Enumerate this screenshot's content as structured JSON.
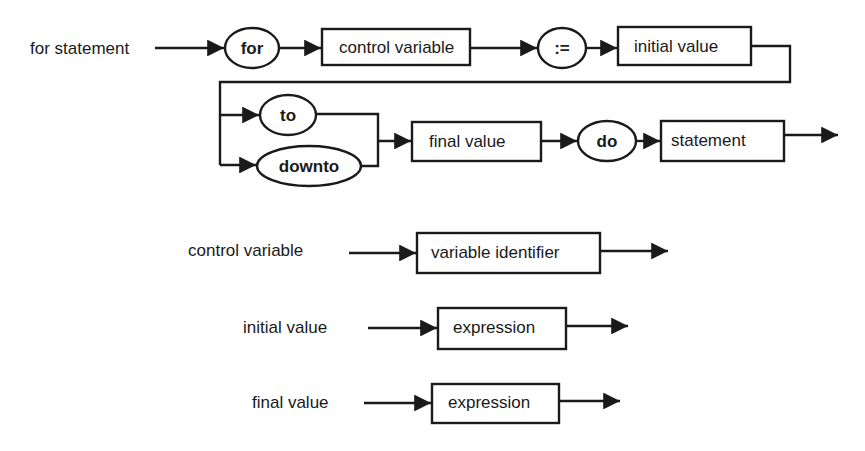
{
  "diagram": {
    "type": "syntax-diagram",
    "main_rule": {
      "name": "for statement",
      "terminals": {
        "for": "for",
        "assign": ":=",
        "to": "to",
        "downto": "downto",
        "do": "do"
      },
      "nonterminals": {
        "control_variable": "control variable",
        "initial_value": "initial value",
        "final_value": "final value",
        "statement": "statement"
      }
    },
    "sub_rules": [
      {
        "name": "control variable",
        "body": "variable identifier"
      },
      {
        "name": "initial value",
        "body": "expression"
      },
      {
        "name": "final value",
        "body": "expression"
      }
    ]
  }
}
